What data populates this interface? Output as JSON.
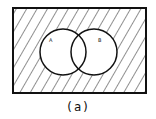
{
  "diagram": {
    "type": "venn",
    "caption": "(a)",
    "sets": [
      {
        "label": "A",
        "cx": 63,
        "cy": 52,
        "r": 23
      },
      {
        "label": "B",
        "cx": 94,
        "cy": 52,
        "r": 23
      }
    ],
    "universe": {
      "x": 13,
      "y": 8,
      "w": 133,
      "h": 85
    },
    "shaded_region": "complement of A union B",
    "colors": {
      "stroke": "#111111",
      "hatch": "#222222",
      "background": "#ffffff"
    }
  }
}
